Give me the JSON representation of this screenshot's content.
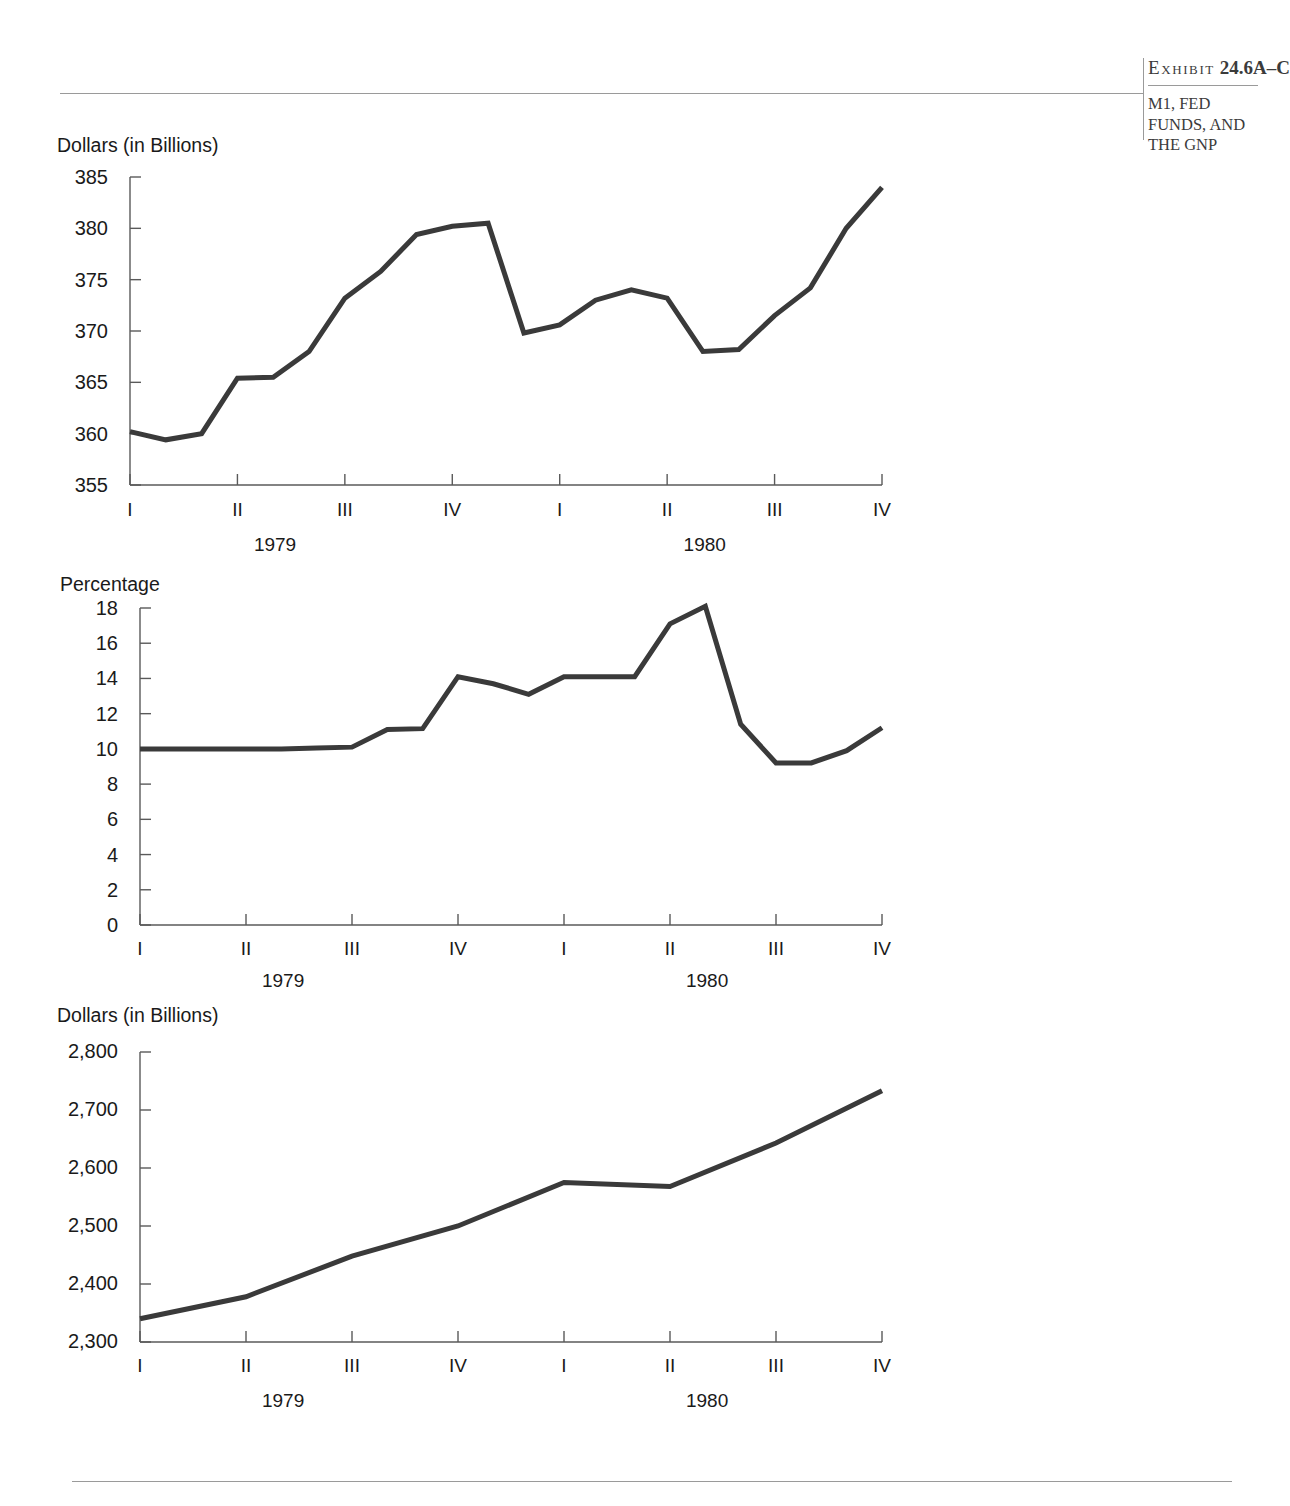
{
  "exhibit": {
    "label_word": "Exhibit",
    "number": "24.6A–C",
    "subtitle": "M1, FED FUNDS, AND THE GNP"
  },
  "periods": {
    "quarters": [
      "I",
      "II",
      "III",
      "IV",
      "I",
      "II",
      "III",
      "IV"
    ],
    "years": [
      "1979",
      "1980"
    ]
  },
  "chart_data": [
    {
      "type": "line",
      "id": "m1",
      "title": "",
      "ylabel": "Dollars (in Billions)",
      "xlabel": "",
      "ylim": [
        355,
        385
      ],
      "yticks": [
        355,
        360,
        365,
        370,
        375,
        380,
        385
      ],
      "ytick_labels": [
        "355",
        "360",
        "365",
        "370",
        "375",
        "380",
        "385"
      ],
      "xtick_labels": [
        "I",
        "II",
        "III",
        "IV",
        "I",
        "II",
        "III",
        "IV"
      ],
      "xgroup_labels": [
        "1979",
        "1980"
      ],
      "grid": false,
      "legend": "none",
      "x": [
        0.0,
        0.33,
        0.67,
        1.0,
        1.33,
        1.67,
        2.0,
        2.33,
        2.67,
        3.0,
        3.33,
        3.67,
        4.0,
        4.33,
        4.67,
        5.0,
        5.33,
        5.67,
        6.0,
        6.33,
        6.67,
        7.0,
        7.33,
        7.67
      ],
      "values": [
        360.2,
        359.4,
        360.0,
        365.4,
        365.5,
        368.0,
        373.2,
        375.8,
        379.4,
        380.2,
        380.5,
        369.8,
        370.6,
        373.0,
        374.0,
        373.2,
        368.0,
        368.2,
        371.5,
        374.2,
        380.0,
        384.0
      ],
      "series_color": "#3a3a3a"
    },
    {
      "type": "line",
      "id": "fed-funds",
      "title": "",
      "ylabel": "Percentage",
      "xlabel": "",
      "ylim": [
        0,
        18
      ],
      "yticks": [
        0,
        2,
        4,
        6,
        8,
        10,
        12,
        14,
        16,
        18
      ],
      "ytick_labels": [
        "0",
        "2",
        "4",
        "6",
        "8",
        "10",
        "12",
        "14",
        "16",
        "18"
      ],
      "xtick_labels": [
        "I",
        "II",
        "III",
        "IV",
        "I",
        "II",
        "III",
        "IV"
      ],
      "xgroup_labels": [
        "1979",
        "1980"
      ],
      "grid": false,
      "legend": "none",
      "values": [
        10.0,
        10.0,
        10.0,
        10.0,
        10.0,
        10.05,
        10.1,
        11.1,
        11.15,
        14.1,
        13.7,
        13.1,
        14.1,
        14.1,
        14.1,
        17.1,
        18.1,
        11.4,
        9.2,
        9.2,
        9.9,
        11.2
      ],
      "series_color": "#3a3a3a"
    },
    {
      "type": "line",
      "id": "gnp",
      "title": "",
      "ylabel": "Dollars (in Billions)",
      "xlabel": "",
      "ylim": [
        2300,
        2800
      ],
      "yticks": [
        2300,
        2400,
        2500,
        2600,
        2700,
        2800
      ],
      "ytick_labels": [
        "2,300",
        "2,400",
        "2,500",
        "2,600",
        "2,700",
        "2,800"
      ],
      "xtick_labels": [
        "I",
        "II",
        "III",
        "IV",
        "I",
        "II",
        "III",
        "IV"
      ],
      "xgroup_labels": [
        "1979",
        "1980"
      ],
      "grid": false,
      "legend": "none",
      "categories": [
        "1979 I",
        "1979 II",
        "1979 III",
        "1979 IV",
        "1980 I",
        "1980 II",
        "1980 III",
        "1980 IV"
      ],
      "values": [
        2340,
        2378,
        2448,
        2500,
        2575,
        2568,
        2643,
        2733
      ],
      "series_color": "#3a3a3a"
    }
  ]
}
